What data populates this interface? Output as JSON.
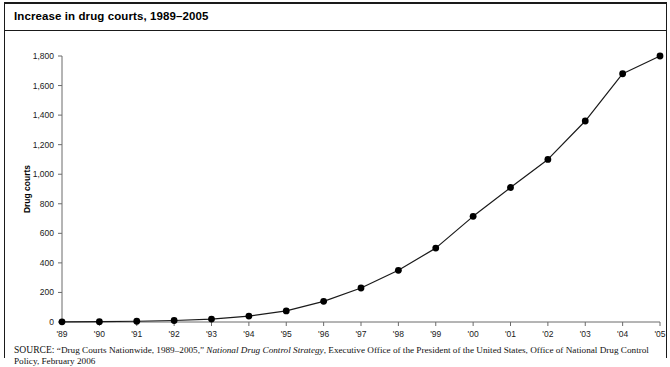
{
  "figure": {
    "title": "Increase in drug courts, 1989–2005"
  },
  "source": {
    "label": "SOURCE:",
    "line1_pre": " “Drug Courts Nationwide, 1989–2005,” ",
    "line1_italic": "National Drug Control Strategy",
    "line1_post": ", Executive Office of the President of the United States, Office of National",
    "line2": "Drug Control Policy, February 2006"
  },
  "chart_data": {
    "type": "line",
    "title": "Increase in drug courts, 1989–2005",
    "xlabel": "",
    "ylabel": "Drug courts",
    "ylim": [
      0,
      1800
    ],
    "ytick_values": [
      0,
      200,
      400,
      600,
      800,
      1000,
      1200,
      1400,
      1600,
      1800
    ],
    "ytick_labels": [
      "0",
      "200",
      "400",
      "600",
      "800",
      "1,000",
      "1,200",
      "1,400",
      "1,600",
      "1,800"
    ],
    "categories": [
      "'89",
      "'90",
      "'91",
      "'92",
      "'93",
      "'94",
      "'95",
      "'96",
      "'97",
      "'98",
      "'99",
      "'00",
      "'01",
      "'02",
      "'03",
      "'04",
      "'05"
    ],
    "x_full_years": [
      1989,
      1990,
      1991,
      1992,
      1993,
      1994,
      1995,
      1996,
      1997,
      1998,
      1999,
      2000,
      2001,
      2002,
      2003,
      2004,
      2005
    ],
    "values": [
      1,
      2,
      5,
      10,
      20,
      40,
      75,
      140,
      230,
      350,
      500,
      715,
      910,
      1100,
      1360,
      1680,
      1800
    ],
    "grid": false,
    "legend": false,
    "marker": "filled-circle",
    "line_color": "#1a1a1a",
    "marker_color": "#000000"
  }
}
